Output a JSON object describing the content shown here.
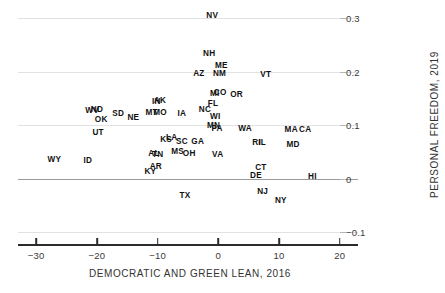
{
  "chart_data": {
    "type": "scatter",
    "title": "",
    "xlabel": "DEMOCRATIC AND GREEN LEAN, 2016",
    "ylabel": "PERSONAL FREEDOM, 2019",
    "xlim": [
      -33,
      23
    ],
    "ylim": [
      -0.105,
      0.315
    ],
    "xticks": [
      -30,
      -20,
      -10,
      0,
      10,
      20
    ],
    "xticklabels": [
      "-30",
      "-20",
      "-10",
      "0",
      "10",
      "20"
    ],
    "yticks": [
      -0.1,
      0,
      0.1,
      0.2,
      0.3
    ],
    "yticklabels": [
      "-0.1",
      "0",
      "0.1",
      "0.2",
      "0.3"
    ],
    "grid": true,
    "legend": "none",
    "marker": "text-label",
    "points": [
      {
        "label": "NV",
        "x": -1.0,
        "y": 0.303
      },
      {
        "label": "NH",
        "x": -1.5,
        "y": 0.232
      },
      {
        "label": "ME",
        "x": 0.5,
        "y": 0.211
      },
      {
        "label": "AZ",
        "x": -3.2,
        "y": 0.196
      },
      {
        "label": "NM",
        "x": 0.2,
        "y": 0.196
      },
      {
        "label": "VT",
        "x": 7.8,
        "y": 0.194
      },
      {
        "label": "MI",
        "x": -0.6,
        "y": 0.159
      },
      {
        "label": "CO",
        "x": 0.3,
        "y": 0.161
      },
      {
        "label": "OR",
        "x": 3.0,
        "y": 0.157
      },
      {
        "label": "AK",
        "x": -9.6,
        "y": 0.146
      },
      {
        "label": "IN",
        "x": -10.2,
        "y": 0.144
      },
      {
        "label": "FL",
        "x": -0.9,
        "y": 0.139
      },
      {
        "label": "WV",
        "x": -20.8,
        "y": 0.126
      },
      {
        "label": "ND",
        "x": -20.0,
        "y": 0.129
      },
      {
        "label": "SD",
        "x": -16.5,
        "y": 0.121
      },
      {
        "label": "MT",
        "x": -11.0,
        "y": 0.122
      },
      {
        "label": "MO",
        "x": -9.6,
        "y": 0.122
      },
      {
        "label": "IA",
        "x": -6.0,
        "y": 0.121
      },
      {
        "label": "NC",
        "x": -2.2,
        "y": 0.129
      },
      {
        "label": "NE",
        "x": -14.0,
        "y": 0.113
      },
      {
        "label": "OK",
        "x": -19.3,
        "y": 0.11
      },
      {
        "label": "WI",
        "x": -0.5,
        "y": 0.116
      },
      {
        "label": "MN",
        "x": -0.8,
        "y": 0.099
      },
      {
        "label": "PA",
        "x": -0.2,
        "y": 0.092
      },
      {
        "label": "WA",
        "x": 4.4,
        "y": 0.092
      },
      {
        "label": "MA",
        "x": 12.0,
        "y": 0.091
      },
      {
        "label": "CA",
        "x": 14.3,
        "y": 0.091
      },
      {
        "label": "UT",
        "x": -19.8,
        "y": 0.086
      },
      {
        "label": "KS",
        "x": -8.6,
        "y": 0.073
      },
      {
        "label": "LA",
        "x": -7.7,
        "y": 0.077
      },
      {
        "label": "SC",
        "x": -6.0,
        "y": 0.068
      },
      {
        "label": "GA",
        "x": -3.4,
        "y": 0.068
      },
      {
        "label": "RI",
        "x": 6.3,
        "y": 0.066
      },
      {
        "label": "IL",
        "x": 7.2,
        "y": 0.066
      },
      {
        "label": "MD",
        "x": 12.3,
        "y": 0.063
      },
      {
        "label": "MS",
        "x": -6.7,
        "y": 0.05
      },
      {
        "label": "OH",
        "x": -4.8,
        "y": 0.046
      },
      {
        "label": "VA",
        "x": -0.1,
        "y": 0.044
      },
      {
        "label": "AL",
        "x": -10.6,
        "y": 0.047
      },
      {
        "label": "TN",
        "x": -10.0,
        "y": 0.044
      },
      {
        "label": "WY",
        "x": -27.0,
        "y": 0.035
      },
      {
        "label": "ID",
        "x": -21.5,
        "y": 0.033
      },
      {
        "label": "AR",
        "x": -10.3,
        "y": 0.022
      },
      {
        "label": "KY",
        "x": -11.2,
        "y": 0.012
      },
      {
        "label": "CT",
        "x": 7.0,
        "y": 0.02
      },
      {
        "label": "DE",
        "x": 6.2,
        "y": 0.005
      },
      {
        "label": "HI",
        "x": 15.5,
        "y": 0.004
      },
      {
        "label": "NJ",
        "x": 7.3,
        "y": -0.024
      },
      {
        "label": "TX",
        "x": -5.5,
        "y": -0.033
      },
      {
        "label": "NY",
        "x": 10.3,
        "y": -0.042
      }
    ]
  },
  "colors": {
    "grid": "#e2e2e2",
    "zero_line": "#9a9a9a",
    "axis": "#2b2b2b",
    "label_text": "#111111",
    "tick_text": "#3a3a3a",
    "title_text": "#333333",
    "background": "#ffffff"
  }
}
